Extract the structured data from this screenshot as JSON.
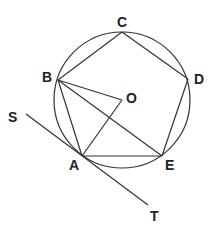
{
  "diagram": {
    "circle": {
      "center": "O",
      "cx": 122,
      "cy": 100,
      "r": 68
    },
    "points": {
      "A": {
        "x": 82,
        "y": 156,
        "label": "A",
        "lx": 69,
        "ly": 170
      },
      "B": {
        "x": 58,
        "y": 80,
        "label": "B",
        "lx": 42,
        "ly": 82
      },
      "C": {
        "x": 122,
        "y": 32,
        "label": "C",
        "lx": 117,
        "ly": 27
      },
      "D": {
        "x": 188,
        "y": 79,
        "label": "D",
        "lx": 194,
        "ly": 84
      },
      "E": {
        "x": 162,
        "y": 156,
        "label": "E",
        "lx": 165,
        "ly": 170
      },
      "O": {
        "x": 122,
        "y": 100,
        "label": "O",
        "lx": 126,
        "ly": 103
      },
      "S": {
        "x": 26,
        "y": 114,
        "label": "S",
        "lx": 8,
        "ly": 122
      },
      "T": {
        "x": 148,
        "y": 205,
        "label": "T",
        "lx": 150,
        "ly": 221
      }
    },
    "segments": [
      [
        "A",
        "B"
      ],
      [
        "B",
        "C"
      ],
      [
        "C",
        "D"
      ],
      [
        "D",
        "E"
      ],
      [
        "E",
        "A"
      ],
      [
        "B",
        "O"
      ],
      [
        "O",
        "A"
      ],
      [
        "B",
        "E"
      ],
      [
        "S",
        "T"
      ]
    ]
  }
}
